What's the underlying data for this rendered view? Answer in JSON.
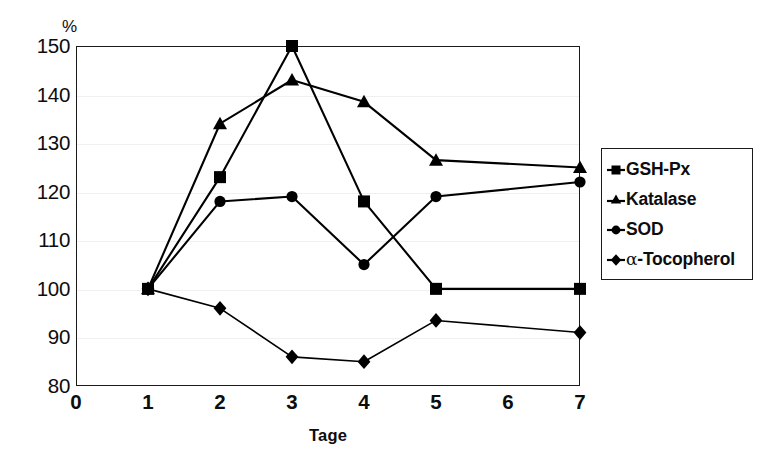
{
  "chart_data": {
    "type": "line",
    "title": "",
    "subtitle": "",
    "xlabel": "Tage",
    "ylabel": "%",
    "x": [
      1,
      2,
      3,
      4,
      5,
      7
    ],
    "xlim": [
      0,
      7
    ],
    "ylim": [
      80,
      150
    ],
    "x_ticks": [
      0,
      1,
      2,
      3,
      4,
      5,
      6,
      7
    ],
    "x_tick_labels": [
      "0",
      "1",
      "2",
      "3",
      "4",
      "5",
      "6",
      "7"
    ],
    "y_ticks": [
      80,
      90,
      100,
      110,
      120,
      130,
      140,
      150
    ],
    "y_tick_labels": [
      "80",
      "90",
      "100",
      "110",
      "120",
      "130",
      "140",
      "150"
    ],
    "grid": false,
    "legend_position": "right",
    "series": [
      {
        "name": "GSH-Px",
        "marker": "square",
        "color": "#000000",
        "values": [
          100,
          123,
          150,
          118,
          100,
          100
        ]
      },
      {
        "name": "Katalase",
        "marker": "triangle",
        "color": "#000000",
        "values": [
          100,
          134,
          143,
          138.5,
          126.5,
          125
        ]
      },
      {
        "name": "SOD",
        "marker": "circle",
        "color": "#000000",
        "values": [
          100,
          118,
          119,
          105,
          119,
          122
        ]
      },
      {
        "name": "α-Tocopherol",
        "marker": "diamond",
        "color": "#000000",
        "values": [
          100,
          96,
          86,
          85,
          93.5,
          91
        ]
      }
    ]
  },
  "axes": {
    "y_unit_label": "%",
    "x_title": "Tage"
  },
  "legend": {
    "items": [
      {
        "label": "GSH-Px",
        "marker": "square"
      },
      {
        "label": "Katalase",
        "marker": "triangle"
      },
      {
        "label": "SOD",
        "marker": "circle"
      },
      {
        "label": "-Tocopherol",
        "marker": "diamond",
        "prefix_symbol": "α"
      }
    ]
  }
}
